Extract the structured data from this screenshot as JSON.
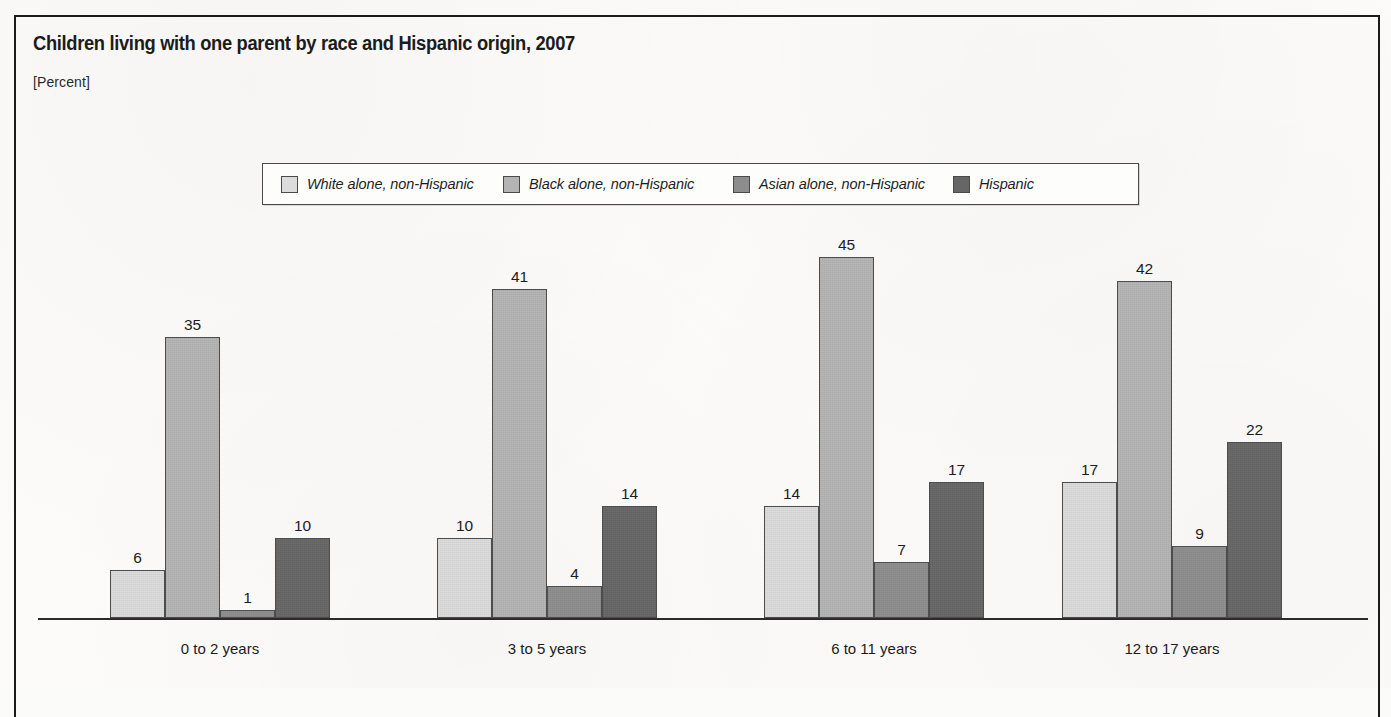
{
  "figure": {
    "title": "Children living with one parent by race and Hispanic origin, 2007",
    "subtitle": "[Percent]"
  },
  "legend": {
    "items": [
      {
        "label": "White alone, non-Hispanic",
        "color": "#dcdcdc"
      },
      {
        "label": "Black alone, non-Hispanic",
        "color": "#b4b4b4"
      },
      {
        "label": "Asian alone, non-Hispanic",
        "color": "#8d8d8d"
      },
      {
        "label": "Hispanic",
        "color": "#666666"
      }
    ]
  },
  "chart_data": {
    "type": "bar",
    "title": "Children living with one parent by race and Hispanic origin, 2007",
    "subtitle": "[Percent]",
    "xlabel": "",
    "ylabel": "Percent",
    "ylim": [
      0,
      50
    ],
    "grid": false,
    "legend_position": "top-center",
    "categories": [
      "0 to 2 years",
      "3 to 5 years",
      "6 to 11 years",
      "12 to 17 years"
    ],
    "series": [
      {
        "name": "White alone, non-Hispanic",
        "color": "#dcdcdc",
        "values": [
          6,
          10,
          14,
          17
        ]
      },
      {
        "name": "Black alone, non-Hispanic",
        "color": "#b4b4b4",
        "values": [
          35,
          41,
          45,
          42
        ]
      },
      {
        "name": "Asian alone, non-Hispanic",
        "color": "#8d8d8d",
        "values": [
          1,
          4,
          7,
          9
        ]
      },
      {
        "name": "Hispanic",
        "color": "#666666",
        "values": [
          10,
          14,
          17,
          22
        ]
      }
    ]
  }
}
